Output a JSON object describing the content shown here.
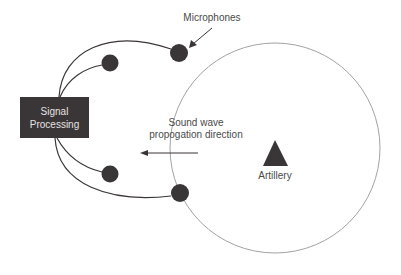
{
  "diagram": {
    "type": "acoustic-artillery-location",
    "signal_processing": {
      "label": "Signal\nProcessing"
    },
    "microphones_label": "Microphones",
    "wave_label_line1": "Sound wave",
    "wave_label_line2": "propogation direction",
    "source_label": "Artillery",
    "microphone_count": 4,
    "colors": {
      "box": "#3a3536",
      "box_text": "#e6e3e3",
      "mic": "#3a3536",
      "wire": "#3a3536",
      "wavefront": "#8a8a8a",
      "text": "#4a4a4a"
    }
  }
}
